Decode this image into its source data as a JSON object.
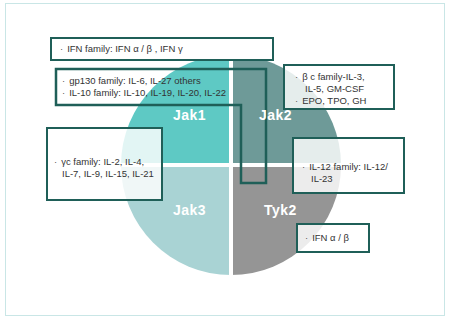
{
  "diagram": {
    "title": "",
    "quadrants": [
      {
        "id": "jak1",
        "label": "Jak1",
        "color": "#5ec9c4"
      },
      {
        "id": "jak2",
        "label": "Jak2",
        "color": "#6e9a98"
      },
      {
        "id": "jak3",
        "label": "Jak3",
        "color": "#a9d3d4"
      },
      {
        "id": "tyk2",
        "label": "Tyk2",
        "color": "#959595"
      }
    ],
    "boxes": {
      "ifn_family": {
        "lines": [
          "IFN family: IFN α / β , IFN γ"
        ]
      },
      "gp130_il10": {
        "lines": [
          "gp130 family: IL-6, IL-27 others",
          "IL-10 family: IL-10, IL-19, IL-20, IL-22"
        ]
      },
      "beta_c": {
        "lines": [
          "β c family-IL-3,",
          "IL-5, GM-CSF",
          "EPO, TPO, GH"
        ]
      },
      "gamma_c": {
        "lines": [
          "γc family: IL-2, IL-4,",
          "IL-7, IL-9, IL-15, IL-21"
        ]
      },
      "il12": {
        "lines": [
          "IL-12 family: IL-12/",
          "IL-23"
        ]
      },
      "ifn_ab": {
        "lines": [
          "IFN α / β"
        ]
      }
    },
    "bullet": "·",
    "colors": {
      "box_border": "#1f5f58",
      "frame_border": "#c9e6e6"
    }
  }
}
